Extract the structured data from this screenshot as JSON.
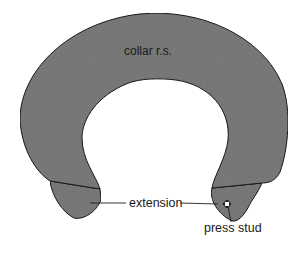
{
  "diagram": {
    "title": "collar r.s.",
    "labels": {
      "collar": "collar r.s.",
      "extension": "extension",
      "press_stud": "press stud"
    },
    "colors": {
      "fill": "#7d7d7d",
      "outline": "#1e1e1e",
      "background": "#ffffff",
      "text": "#1a1a1a"
    },
    "parts": [
      "collar body",
      "left extension",
      "right extension",
      "press stud"
    ]
  }
}
